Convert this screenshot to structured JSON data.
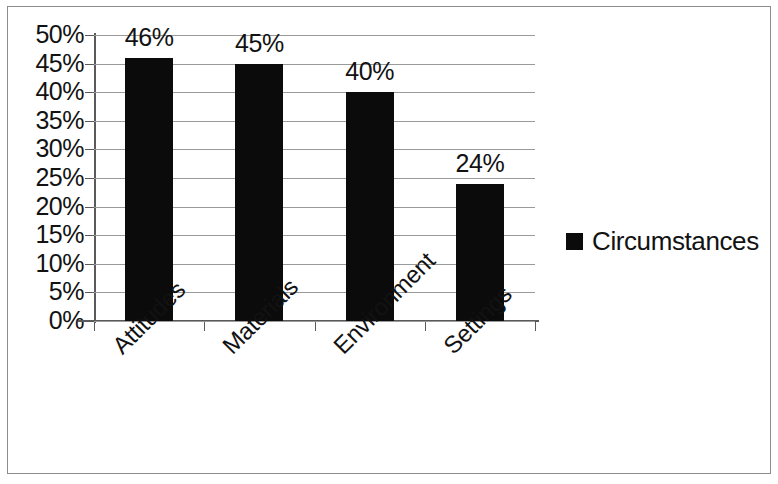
{
  "chart_data": {
    "type": "bar",
    "title": "",
    "xlabel": "",
    "ylabel": "",
    "categories": [
      "Attitudes",
      "Materials",
      "Environment",
      "Settings"
    ],
    "values": [
      46,
      45,
      40,
      24
    ],
    "value_labels": [
      "46%",
      "45%",
      "40%",
      "24%"
    ],
    "series": [
      {
        "name": "Circumstances",
        "values": [
          46,
          45,
          40,
          24
        ],
        "color": "#0b0b0b"
      }
    ],
    "ylim": [
      0,
      50
    ],
    "ytick_values": [
      50,
      45,
      40,
      35,
      30,
      25,
      20,
      15,
      10,
      5,
      0
    ],
    "ytick_labels": [
      "50%",
      "45%",
      "40%",
      "35%",
      "30%",
      "25%",
      "20%",
      "15%",
      "10%",
      "5%",
      "0%"
    ],
    "grid": true,
    "grid_axis": "y",
    "legend_position": "right",
    "legend_entries": [
      {
        "label": "Circumstances",
        "marker": "square",
        "color": "#0b0b0b"
      }
    ],
    "xtick_label_rotation": -45,
    "border": true
  },
  "figure": {
    "background_color": "#ffffff",
    "border_color": "#8d8d8d",
    "axis_color": "#5a5a5a",
    "gridline_color": "#9a9a9a",
    "text_color": "#121212"
  }
}
